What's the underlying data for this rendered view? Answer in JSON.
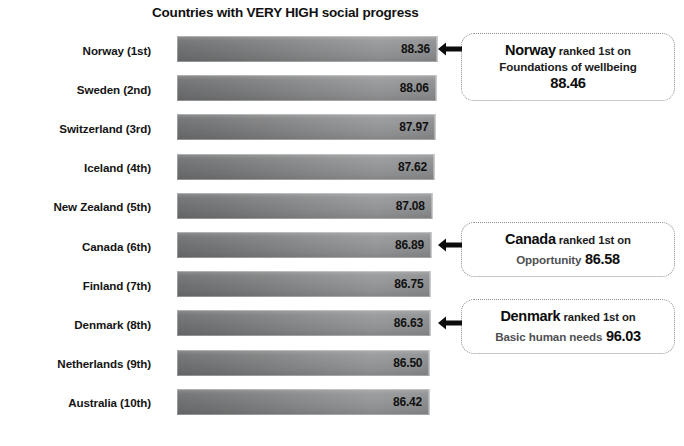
{
  "chart_data": {
    "type": "bar",
    "title": "Countries with VERY HIGH social progress",
    "xlabel": "",
    "ylabel": "",
    "orientation": "horizontal",
    "grid": false,
    "legend": "none",
    "xlim": [
      0,
      88.36
    ],
    "categories": [
      "Norway (1st)",
      "Sweden (2nd)",
      "Switzerland (3rd)",
      "Iceland (4th)",
      "New Zealand (5th)",
      "Canada (6th)",
      "Finland (7th)",
      "Denmark (8th)",
      "Netherlands (9th)",
      "Australia (10th)"
    ],
    "values": [
      88.36,
      88.06,
      87.97,
      87.62,
      87.08,
      86.89,
      86.75,
      86.63,
      86.5,
      86.42
    ],
    "value_labels": [
      "88.36",
      "88.06",
      "87.97",
      "87.62",
      "87.08",
      "86.89",
      "86.75",
      "86.63",
      "86.50",
      "86.42"
    ],
    "annotations": [
      {
        "target_category": "Norway (1st)",
        "country": "Norway",
        "rank_text": "ranked 1st on",
        "dimension": "Foundations of wellbeing",
        "score": "88.46",
        "score_layout": "below"
      },
      {
        "target_category": "Canada (6th)",
        "country": "Canada",
        "rank_text": "ranked 1st on",
        "dimension": "Opportunity",
        "score": "86.58",
        "score_layout": "inline"
      },
      {
        "target_category": "Denmark (8th)",
        "country": "Denmark",
        "rank_text": "ranked 1st on",
        "dimension": "Basic human needs",
        "score": "96.03",
        "score_layout": "inline"
      }
    ]
  },
  "colors": {
    "background": "#ffffff",
    "bar_left": "#6f7072",
    "bar_right": "#97989a",
    "text": "#111111",
    "callout_border": "#8d8e90",
    "callout_dim_text": "#4f5052"
  },
  "icons": {
    "arrow": "left-arrow-icon"
  }
}
